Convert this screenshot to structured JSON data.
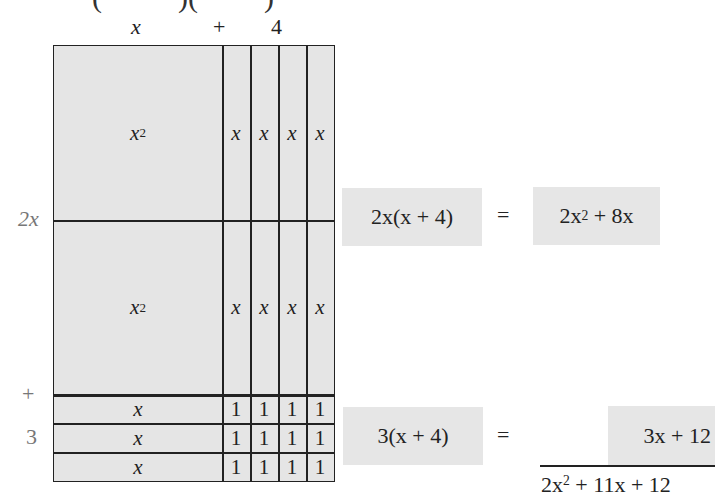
{
  "header": {
    "clipped_top": [
      "(",
      ")(",
      ")"
    ],
    "col_labels": {
      "x": "x",
      "plus": "+",
      "four": "4"
    }
  },
  "side_labels": {
    "two_x": "2x",
    "plus": "+",
    "three": "3"
  },
  "grid": {
    "upper": {
      "square_label": "x",
      "square_exp": "2",
      "strip_label": "x",
      "strips": 4
    },
    "lower": {
      "square_label": "x",
      "square_exp": "2",
      "strip_label": "x",
      "strips": 4
    },
    "unit_rows": [
      {
        "label": "x",
        "ones": [
          "1",
          "1",
          "1",
          "1"
        ]
      },
      {
        "label": "x",
        "ones": [
          "1",
          "1",
          "1",
          "1"
        ]
      },
      {
        "label": "x",
        "ones": [
          "1",
          "1",
          "1",
          "1"
        ]
      }
    ]
  },
  "equations": {
    "eq1": {
      "lhs": "2x(x + 4)",
      "equals": "=",
      "rhs_a": "2x",
      "rhs_exp": "2",
      "rhs_b": " + 8x"
    },
    "eq2": {
      "lhs": "3(x + 4)",
      "equals": "=",
      "rhs": "3x + 12"
    },
    "total": {
      "a": "2x",
      "exp": "2",
      "b": " + 11x + 12"
    }
  },
  "colors": {
    "fill": "#e5e5e5",
    "line": "#222222",
    "label_gray": "#777777"
  }
}
